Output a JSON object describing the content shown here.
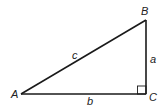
{
  "diagram": {
    "vertices": [
      {
        "name": "A",
        "label": "A"
      },
      {
        "name": "B",
        "label": "B"
      },
      {
        "name": "C",
        "label": "C"
      }
    ],
    "sides": [
      {
        "name": "a",
        "label": "a",
        "between": "B-C"
      },
      {
        "name": "b",
        "label": "b",
        "between": "A-C"
      },
      {
        "name": "c",
        "label": "c",
        "between": "A-B"
      }
    ],
    "right_angle_at": "C"
  }
}
